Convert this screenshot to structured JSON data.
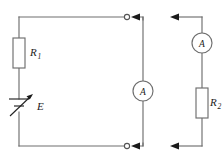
{
  "figure": {
    "width": 222,
    "height": 165,
    "background_color": "#ffffff",
    "wire_color": "#6e6e6e",
    "arrow_color": "#1a1a1a",
    "label_color": "#1c1c1c"
  },
  "labels": {
    "r1_symbol": "R",
    "r1_subscript": "1",
    "r2_symbol": "R",
    "r2_subscript": "2",
    "source_symbol": "E",
    "ammeter_left_symbol": "A",
    "ammeter_right_symbol": "A"
  },
  "components": [
    {
      "name": "resistor-r1",
      "kind": "resistor",
      "label": "R1",
      "branch": "left",
      "orientation": "vertical"
    },
    {
      "name": "variable-emf-source",
      "kind": "variable-voltage-source",
      "label": "E",
      "branch": "left",
      "orientation": "vertical"
    },
    {
      "name": "ammeter-middle",
      "kind": "ammeter",
      "label": "A",
      "branch": "middle",
      "orientation": "vertical"
    },
    {
      "name": "ammeter-right",
      "kind": "ammeter",
      "label": "A",
      "branch": "right",
      "orientation": "vertical"
    },
    {
      "name": "resistor-r2",
      "kind": "resistor",
      "label": "R2",
      "branch": "right",
      "orientation": "vertical"
    }
  ],
  "terminals": [
    {
      "name": "terminal-top",
      "style": "open-circle"
    },
    {
      "name": "terminal-bottom",
      "style": "open-circle"
    }
  ],
  "current_arrows": [
    {
      "name": "current-arrow-top-middle",
      "direction": "left"
    },
    {
      "name": "current-arrow-bottom-middle",
      "direction": "left"
    },
    {
      "name": "current-arrow-top-right",
      "direction": "left"
    },
    {
      "name": "current-arrow-bottom-right",
      "direction": "left"
    }
  ]
}
